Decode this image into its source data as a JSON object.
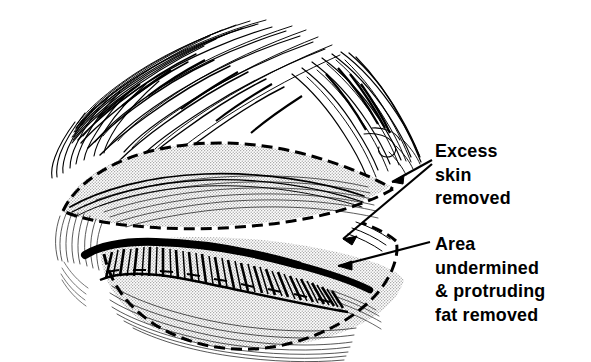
{
  "figure": {
    "ink_color": "#000000",
    "background_color": "#ffffff",
    "stipple_color": "#d9d9d9"
  },
  "callouts": [
    {
      "id": "excess-skin",
      "lines": [
        "Excess",
        "skin",
        "removed"
      ],
      "arrow_count": 2
    },
    {
      "id": "area-undermined",
      "lines": [
        "Area",
        "undermined",
        "& protruding",
        "fat removed"
      ],
      "arrow_count": 1
    }
  ],
  "anatomy": {
    "eyebrow_label": "eyebrow",
    "upper_lid_label": "upper-eyelid-excision-zone",
    "lash_line_label": "eyelash-line",
    "lower_lid_label": "lower-eyelid-undermined-zone"
  }
}
